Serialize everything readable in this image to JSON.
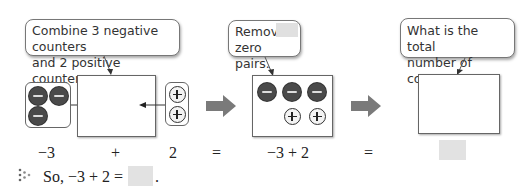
{
  "callouts": {
    "combine": {
      "line1": "Combine 3 negative counters",
      "line2": "and 2 positive counters."
    },
    "remove": {
      "line1": "Remove",
      "line2": "zero pairs."
    },
    "total": {
      "line1": "What is the total",
      "line2": "number of counters?"
    }
  },
  "counters": {
    "group1": {
      "negative": 3,
      "positive": 0
    },
    "group2": {
      "negative": 0,
      "positive": 2
    },
    "combined": {
      "negative": 3,
      "positive": 2
    },
    "result": {
      "negative": 0,
      "positive": 0
    }
  },
  "equation": {
    "term1": "−3",
    "plus": "+",
    "term2": "2",
    "equals1": "=",
    "combined": "−3 + 2",
    "equals2": "=",
    "answer": ""
  },
  "conclusion": {
    "prefix": "So, −3 + 2 =",
    "answer": "",
    "suffix": "."
  },
  "colors": {
    "negative_counter": "#4a4a4a",
    "positive_counter": "#f3f3f3",
    "arrow": "#7a7a7a",
    "blank": "#e2e2e2"
  }
}
